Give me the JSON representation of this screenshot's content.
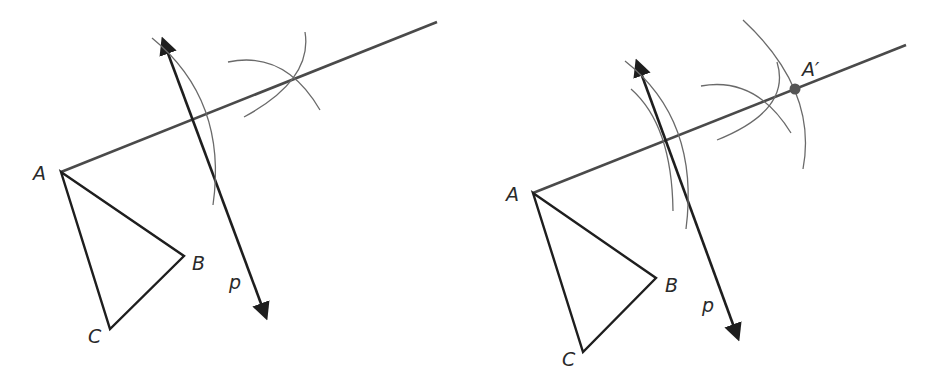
{
  "figures": [
    {
      "id": "left",
      "labels": {
        "A": "A",
        "B": "B",
        "C": "C",
        "p": "p"
      },
      "points": {
        "A": [
          61,
          172
        ],
        "B": [
          184,
          256
        ],
        "C": [
          110,
          329
        ]
      },
      "ray_end": [
        437,
        22
      ],
      "line_p": {
        "start": [
          160,
          33
        ],
        "end": [
          268,
          322
        ]
      }
    },
    {
      "id": "right",
      "labels": {
        "A": "A",
        "B": "B",
        "C": "C",
        "p": "p",
        "A_prime": "A′"
      },
      "points": {
        "A": [
          533,
          193
        ],
        "B": [
          656,
          278
        ],
        "C": [
          583,
          352
        ],
        "A_prime": [
          795,
          89
        ]
      },
      "ray_end": [
        906,
        45
      ],
      "line_p": {
        "start": [
          634,
          56
        ],
        "end": [
          740,
          344
        ]
      }
    }
  ],
  "colors": {
    "stroke_dark": "#1e1e1e",
    "ray": "#4a4a4a",
    "arc": "#6a6a6a",
    "point": "#555555"
  }
}
